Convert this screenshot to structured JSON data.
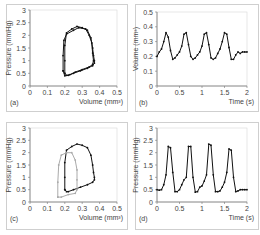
{
  "chart_data": [
    {
      "id": "a",
      "type": "scatter",
      "panel_label": "(a)",
      "xlabel": "Volume (mm³)",
      "ylabel": "Pressure (mmHg)",
      "xlim": [
        0,
        0.5
      ],
      "ylim": [
        0,
        3
      ],
      "xticks": [
        "0",
        "0.1",
        "0.2",
        "0.3",
        "0.4",
        "0.5"
      ],
      "yticks": [
        "0",
        "0.5",
        "1",
        "1.5",
        "2",
        "2.5",
        "3"
      ],
      "series": [
        {
          "name": "PV loop",
          "color": "#111111",
          "x": [
            0.2,
            0.2,
            0.2,
            0.21,
            0.24,
            0.27,
            0.3,
            0.33,
            0.35,
            0.36,
            0.365,
            0.37,
            0.37,
            0.36,
            0.33,
            0.29,
            0.25,
            0.22,
            0.21,
            0.2
          ],
          "y": [
            0.5,
            1.0,
            1.6,
            2.1,
            2.25,
            2.35,
            2.3,
            2.2,
            1.9,
            1.5,
            1.2,
            1.0,
            0.9,
            0.8,
            0.7,
            0.6,
            0.5,
            0.42,
            0.42,
            0.5
          ]
        },
        {
          "name": "PV loop 2",
          "color": "#111111",
          "x": [
            0.19,
            0.19,
            0.195,
            0.21,
            0.25,
            0.28,
            0.32,
            0.34,
            0.355,
            0.36,
            0.365,
            0.36,
            0.34,
            0.3,
            0.26,
            0.23,
            0.2,
            0.19
          ],
          "y": [
            0.6,
            1.2,
            1.8,
            2.05,
            2.2,
            2.3,
            2.25,
            2.0,
            1.7,
            1.3,
            1.0,
            0.85,
            0.75,
            0.65,
            0.55,
            0.45,
            0.4,
            0.6
          ]
        }
      ]
    },
    {
      "id": "b",
      "type": "line",
      "panel_label": "(b)",
      "xlabel": "Time (s)",
      "ylabel": "Volume (mm³)",
      "xlim": [
        0,
        2
      ],
      "ylim": [
        0,
        0.5
      ],
      "xticks": [
        "0",
        "0.5",
        "1",
        "1.5",
        "2"
      ],
      "yticks": [
        "0",
        "0.1",
        "0.2",
        "0.3",
        "0.4",
        "0.5"
      ],
      "series": [
        {
          "name": "Volume",
          "color": "#111111",
          "x": [
            0,
            0.05,
            0.1,
            0.15,
            0.2,
            0.25,
            0.3,
            0.35,
            0.4,
            0.45,
            0.5,
            0.55,
            0.6,
            0.65,
            0.7,
            0.75,
            0.8,
            0.85,
            0.9,
            0.95,
            1.0,
            1.05,
            1.1,
            1.15,
            1.2,
            1.25,
            1.3,
            1.35,
            1.4,
            1.45,
            1.5,
            1.55,
            1.6,
            1.65,
            1.7,
            1.75,
            1.8,
            1.85,
            1.9,
            1.95,
            2.0
          ],
          "y": [
            0.2,
            0.23,
            0.25,
            0.3,
            0.36,
            0.33,
            0.24,
            0.18,
            0.19,
            0.21,
            0.23,
            0.27,
            0.35,
            0.36,
            0.28,
            0.2,
            0.18,
            0.19,
            0.21,
            0.23,
            0.27,
            0.35,
            0.36,
            0.28,
            0.19,
            0.18,
            0.19,
            0.22,
            0.25,
            0.3,
            0.36,
            0.35,
            0.26,
            0.18,
            0.18,
            0.21,
            0.23,
            0.22,
            0.23,
            0.23,
            0.23
          ]
        }
      ]
    },
    {
      "id": "c",
      "type": "scatter",
      "panel_label": "(c)",
      "xlabel": "Volume (mm³)",
      "ylabel": "Pressure (mmHg)",
      "xlim": [
        0,
        0.5
      ],
      "ylim": [
        0,
        3
      ],
      "xticks": [
        "0",
        "0.1",
        "0.2",
        "0.3",
        "0.4",
        "0.5"
      ],
      "yticks": [
        "0",
        "0.5",
        "1",
        "1.5",
        "2",
        "2.5",
        "3"
      ],
      "series": [
        {
          "name": "PV loop",
          "color": "#111111",
          "x": [
            0.2,
            0.2,
            0.2,
            0.21,
            0.24,
            0.27,
            0.3,
            0.33,
            0.35,
            0.36,
            0.365,
            0.37,
            0.37,
            0.36,
            0.33,
            0.29,
            0.25,
            0.22,
            0.21,
            0.2
          ],
          "y": [
            0.5,
            1.0,
            1.6,
            2.1,
            2.25,
            2.35,
            2.3,
            2.2,
            1.9,
            1.5,
            1.2,
            1.0,
            0.9,
            0.8,
            0.7,
            0.6,
            0.5,
            0.42,
            0.42,
            0.5
          ]
        },
        {
          "name": "Reference loop",
          "color": "#aaaaaa",
          "x": [
            0.16,
            0.16,
            0.165,
            0.18,
            0.21,
            0.24,
            0.26,
            0.27,
            0.27,
            0.27,
            0.26,
            0.22,
            0.18,
            0.16
          ],
          "y": [
            0.2,
            0.8,
            1.5,
            1.9,
            2.0,
            2.0,
            1.7,
            1.3,
            0.9,
            0.5,
            0.35,
            0.3,
            0.2,
            0.2
          ]
        }
      ]
    },
    {
      "id": "d",
      "type": "line",
      "panel_label": "(d)",
      "xlabel": "Time (s)",
      "ylabel": "Pressure (mmHg)",
      "xlim": [
        0,
        2
      ],
      "ylim": [
        0,
        3
      ],
      "xticks": [
        "0",
        "0.5",
        "1",
        "1.5",
        "2"
      ],
      "yticks": [
        "0",
        "0.5",
        "1",
        "1.5",
        "2",
        "2.5",
        "3"
      ],
      "series": [
        {
          "name": "Pressure",
          "color": "#111111",
          "x": [
            0,
            0.05,
            0.1,
            0.15,
            0.2,
            0.25,
            0.3,
            0.35,
            0.4,
            0.45,
            0.5,
            0.55,
            0.6,
            0.65,
            0.7,
            0.75,
            0.8,
            0.85,
            0.9,
            0.95,
            1.0,
            1.05,
            1.1,
            1.15,
            1.2,
            1.25,
            1.3,
            1.35,
            1.4,
            1.45,
            1.5,
            1.55,
            1.6,
            1.65,
            1.7,
            1.75,
            1.8,
            1.85,
            1.9,
            1.95,
            2.0
          ],
          "y": [
            0.5,
            0.48,
            0.5,
            0.7,
            1.1,
            2.25,
            2.2,
            1.2,
            0.42,
            0.42,
            0.5,
            0.7,
            0.9,
            1.0,
            2.25,
            2.25,
            1.0,
            0.4,
            0.42,
            0.6,
            0.65,
            0.85,
            1.1,
            2.35,
            2.3,
            1.1,
            0.42,
            0.42,
            0.45,
            0.6,
            0.8,
            1.2,
            2.15,
            2.1,
            1.0,
            0.42,
            0.45,
            0.5,
            0.5,
            0.5,
            0.5
          ]
        }
      ]
    }
  ]
}
